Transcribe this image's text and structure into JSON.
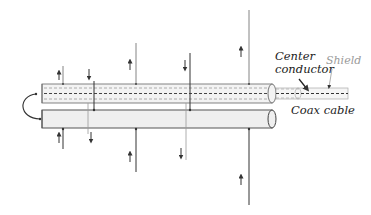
{
  "diagram": {
    "title": "",
    "labels": {
      "center_conductor_line1": "Center",
      "center_conductor_line2": "conductor",
      "shield": "Shield",
      "coax_cable": "Coax cable"
    },
    "components": [
      {
        "id": "coax-cable",
        "type": "cylinder-with-dashed-core",
        "note": "top conductor with dashed center conductor and shield"
      },
      {
        "id": "return-conductor",
        "type": "solid-cylinder",
        "note": "bottom conductor"
      },
      {
        "id": "loop",
        "type": "curved-wire",
        "note": "left end connecting center conductor to bottom conductor"
      }
    ],
    "field_lines": [
      {
        "x": 63,
        "side": "top",
        "direction": "up"
      },
      {
        "x": 94,
        "side": "top",
        "direction": "down"
      },
      {
        "x": 136,
        "side": "top",
        "direction": "up"
      },
      {
        "x": 190,
        "side": "top",
        "direction": "down"
      },
      {
        "x": 249,
        "side": "top",
        "direction": "up"
      },
      {
        "x": 63,
        "side": "bottom",
        "direction": "up"
      },
      {
        "x": 90,
        "side": "bottom",
        "direction": "down"
      },
      {
        "x": 136,
        "side": "bottom",
        "direction": "up"
      },
      {
        "x": 186,
        "side": "bottom",
        "direction": "down"
      },
      {
        "x": 249,
        "side": "bottom",
        "direction": "up"
      }
    ],
    "colors": {
      "line_dark": "#333333",
      "line_grey": "#8a8a8a",
      "cylinder_fill": "#efefef",
      "text": "#222222",
      "shield_text": "#9a9a9a"
    }
  }
}
